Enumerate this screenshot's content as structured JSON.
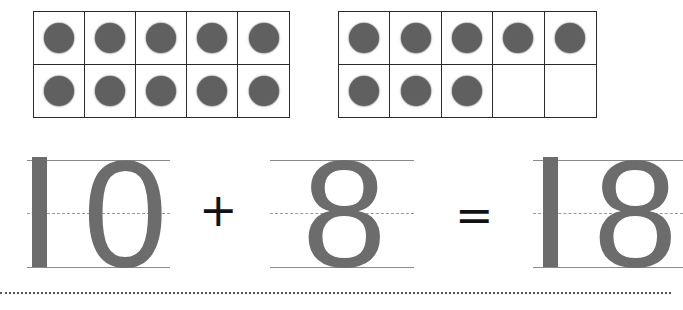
{
  "worksheet": {
    "ten_frames": [
      {
        "id": "left",
        "filled": 10,
        "total": 10,
        "rows": 2,
        "cols": 5
      },
      {
        "id": "right",
        "filled": 8,
        "total": 10,
        "rows": 2,
        "cols": 5
      }
    ],
    "equation": {
      "addend_1": {
        "tens_digit": "1",
        "ones_digit": "0",
        "value": 10
      },
      "operator_1": "+",
      "addend_2": {
        "ones_digit": "8",
        "value": 8
      },
      "operator_2": "=",
      "sum": {
        "tens_digit": "1",
        "ones_digit": "8",
        "value": 18
      }
    },
    "colors": {
      "counter": "#606060",
      "digit": "#6c6c6c",
      "grid_line": "#2a2a2a",
      "guide_line": "#8a8a8a",
      "operator": "#111111"
    }
  }
}
